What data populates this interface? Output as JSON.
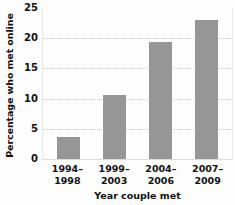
{
  "chart_data": {
    "type": "bar",
    "title": "",
    "xlabel": "Year couple met",
    "ylabel": "Percentage who met online",
    "categories": [
      "1994–1998",
      "1999–2003",
      "2004–2006",
      "2007–2009"
    ],
    "category_lines": [
      [
        "1994–",
        "1998"
      ],
      [
        "1999–",
        "2003"
      ],
      [
        "2004–",
        "2006"
      ],
      [
        "2007–",
        "2009"
      ]
    ],
    "values": [
      3.7,
      10.6,
      19.3,
      23.0
    ],
    "ylim": [
      0,
      25
    ],
    "yticks": [
      0,
      5,
      10,
      15,
      20,
      25
    ],
    "ytick_labels": [
      "0",
      "5",
      "10",
      "15",
      "20",
      "25"
    ],
    "grid": true,
    "grid_axis": "y",
    "grid_style": "dotted",
    "legend": false,
    "bar_color": "#969696",
    "grid_color": "#c9c9c9",
    "background": "#fdfdfd",
    "text_color": "#111111"
  }
}
